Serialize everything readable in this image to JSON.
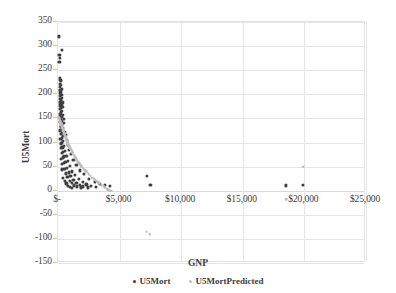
{
  "chart_data": {
    "type": "scatter",
    "title": "",
    "xlabel": "GNP",
    "ylabel": "U5Mort",
    "xlim": [
      0,
      25000
    ],
    "ylim": [
      -150,
      350
    ],
    "grid": true,
    "legend_position": "bottom",
    "xticks": [
      0,
      5000,
      10000,
      15000,
      20000,
      25000
    ],
    "xtick_labels": [
      "$-",
      "$5,000",
      "$10,000",
      "$15,000",
      "$20,000",
      "$25,000"
    ],
    "yticks": [
      -150,
      -100,
      -50,
      0,
      50,
      100,
      150,
      200,
      250,
      300,
      350
    ],
    "ytick_labels": [
      "-150",
      "-100",
      "-50",
      "0",
      "50",
      "100",
      "150",
      "200",
      "250",
      "300",
      "350"
    ],
    "series": [
      {
        "name": "U5Mort",
        "color": "#3f3f3f",
        "marker": "circle",
        "marker_size": 3.2,
        "points": [
          [
            60,
            320
          ],
          [
            300,
            292
          ],
          [
            120,
            282
          ],
          [
            130,
            276
          ],
          [
            110,
            268
          ],
          [
            150,
            234
          ],
          [
            200,
            230
          ],
          [
            260,
            228
          ],
          [
            175,
            222
          ],
          [
            230,
            219
          ],
          [
            140,
            215
          ],
          [
            300,
            212
          ],
          [
            190,
            208
          ],
          [
            250,
            205
          ],
          [
            160,
            203
          ],
          [
            210,
            200
          ],
          [
            280,
            198
          ],
          [
            135,
            196
          ],
          [
            320,
            193
          ],
          [
            170,
            190
          ],
          [
            240,
            188
          ],
          [
            200,
            185
          ],
          [
            360,
            183
          ],
          [
            150,
            180
          ],
          [
            290,
            178
          ],
          [
            190,
            176
          ],
          [
            420,
            174
          ],
          [
            230,
            171
          ],
          [
            165,
            169
          ],
          [
            310,
            166
          ],
          [
            260,
            163
          ],
          [
            200,
            160
          ],
          [
            380,
            158
          ],
          [
            175,
            156
          ],
          [
            330,
            153
          ],
          [
            240,
            151
          ],
          [
            450,
            149
          ],
          [
            210,
            147
          ],
          [
            290,
            144
          ],
          [
            185,
            142
          ],
          [
            500,
            140
          ],
          [
            350,
            137
          ],
          [
            260,
            135
          ],
          [
            220,
            132
          ],
          [
            400,
            130
          ],
          [
            300,
            127
          ],
          [
            180,
            125
          ],
          [
            560,
            122
          ],
          [
            340,
            120
          ],
          [
            250,
            118
          ],
          [
            620,
            115
          ],
          [
            430,
            113
          ],
          [
            290,
            110
          ],
          [
            200,
            108
          ],
          [
            700,
            106
          ],
          [
            380,
            103
          ],
          [
            330,
            100
          ],
          [
            240,
            98
          ],
          [
            790,
            95
          ],
          [
            480,
            93
          ],
          [
            360,
            90
          ],
          [
            260,
            88
          ],
          [
            900,
            85
          ],
          [
            560,
            83
          ],
          [
            430,
            80
          ],
          [
            310,
            78
          ],
          [
            1050,
            76
          ],
          [
            680,
            73
          ],
          [
            490,
            71
          ],
          [
            380,
            69
          ],
          [
            230,
            66
          ],
          [
            1250,
            64
          ],
          [
            800,
            62
          ],
          [
            600,
            59
          ],
          [
            450,
            57
          ],
          [
            300,
            55
          ],
          [
            1500,
            53
          ],
          [
            980,
            51
          ],
          [
            720,
            48
          ],
          [
            520,
            46
          ],
          [
            340,
            44
          ],
          [
            1800,
            42
          ],
          [
            1150,
            40
          ],
          [
            870,
            38
          ],
          [
            640,
            36
          ],
          [
            2100,
            34
          ],
          [
            1400,
            32
          ],
          [
            1000,
            30
          ],
          [
            760,
            28
          ],
          [
            430,
            26
          ],
          [
            2500,
            25
          ],
          [
            1700,
            24
          ],
          [
            1250,
            22
          ],
          [
            940,
            21
          ],
          [
            560,
            20
          ],
          [
            3000,
            19
          ],
          [
            2000,
            18
          ],
          [
            1500,
            17
          ],
          [
            1100,
            16
          ],
          [
            680,
            15
          ],
          [
            3400,
            14
          ],
          [
            2300,
            13
          ],
          [
            1750,
            12
          ],
          [
            1300,
            11
          ],
          [
            820,
            10
          ],
          [
            3800,
            12
          ],
          [
            2700,
            10
          ],
          [
            2050,
            9
          ],
          [
            1550,
            9
          ],
          [
            980,
            8
          ],
          [
            4200,
            10
          ],
          [
            3100,
            8
          ],
          [
            2400,
            7
          ],
          [
            1850,
            7
          ],
          [
            1150,
            6
          ],
          [
            7200,
            30
          ],
          [
            7500,
            12
          ],
          [
            18500,
            11
          ],
          [
            19900,
            12
          ]
        ]
      },
      {
        "name": "U5MortPredicted",
        "color": "#bdbdbd",
        "marker": "circle",
        "marker_size": 2.6,
        "points": [
          [
            60,
            152
          ],
          [
            90,
            150
          ],
          [
            110,
            149
          ],
          [
            130,
            147
          ],
          [
            150,
            146
          ],
          [
            170,
            144
          ],
          [
            190,
            143
          ],
          [
            210,
            141
          ],
          [
            230,
            140
          ],
          [
            250,
            138
          ],
          [
            270,
            137
          ],
          [
            290,
            135
          ],
          [
            310,
            134
          ],
          [
            330,
            132
          ],
          [
            350,
            131
          ],
          [
            370,
            129
          ],
          [
            390,
            128
          ],
          [
            410,
            126
          ],
          [
            430,
            125
          ],
          [
            450,
            123
          ],
          [
            470,
            122
          ],
          [
            490,
            120
          ],
          [
            510,
            119
          ],
          [
            530,
            117
          ],
          [
            560,
            115
          ],
          [
            590,
            113
          ],
          [
            620,
            111
          ],
          [
            650,
            109
          ],
          [
            680,
            107
          ],
          [
            710,
            105
          ],
          [
            740,
            103
          ],
          [
            770,
            101
          ],
          [
            800,
            99
          ],
          [
            840,
            97
          ],
          [
            880,
            94
          ],
          [
            920,
            92
          ],
          [
            960,
            90
          ],
          [
            1000,
            88
          ],
          [
            1050,
            85
          ],
          [
            1100,
            83
          ],
          [
            1150,
            80
          ],
          [
            1200,
            78
          ],
          [
            1260,
            75
          ],
          [
            1320,
            73
          ],
          [
            1380,
            70
          ],
          [
            1440,
            68
          ],
          [
            1500,
            65
          ],
          [
            1580,
            62
          ],
          [
            1660,
            59
          ],
          [
            1740,
            57
          ],
          [
            1820,
            54
          ],
          [
            1900,
            51
          ],
          [
            2000,
            48
          ],
          [
            2100,
            45
          ],
          [
            2200,
            42
          ],
          [
            2300,
            40
          ],
          [
            2400,
            37
          ],
          [
            2500,
            34
          ],
          [
            2650,
            31
          ],
          [
            2800,
            27
          ],
          [
            2950,
            24
          ],
          [
            3100,
            21
          ],
          [
            3250,
            18
          ],
          [
            3400,
            15
          ],
          [
            3550,
            12
          ],
          [
            3700,
            9
          ],
          [
            3850,
            6
          ],
          [
            4000,
            3
          ],
          [
            4150,
            1
          ],
          [
            4300,
            0
          ],
          [
            7200,
            -85
          ],
          [
            7450,
            -90
          ],
          [
            18500,
            -18
          ],
          [
            19900,
            50
          ]
        ]
      }
    ]
  },
  "axis": {
    "y_title": "U5Mort",
    "x_title": "GNP"
  },
  "legend": {
    "items": [
      {
        "label": "U5Mort",
        "color": "#3f3f3f"
      },
      {
        "label": "U5MortPredicted",
        "color": "#bdbdbd"
      }
    ]
  }
}
